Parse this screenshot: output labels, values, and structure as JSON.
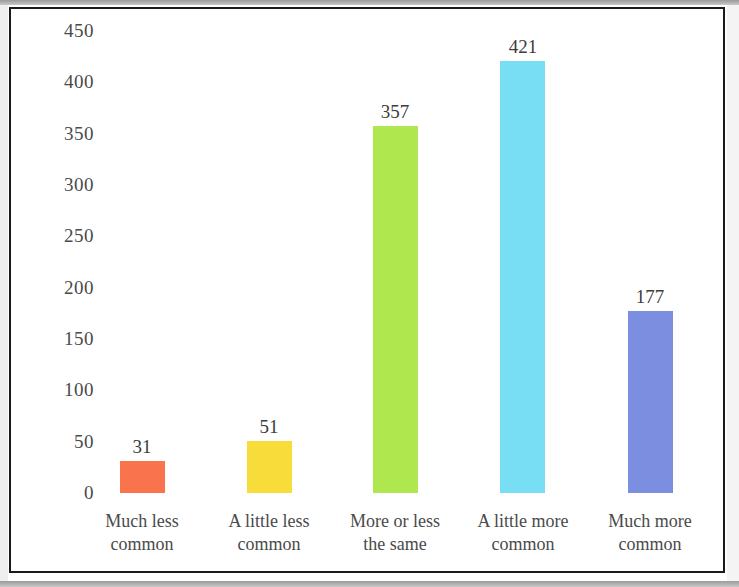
{
  "chart_data": {
    "type": "bar",
    "title": "",
    "subtitle": "",
    "xlabel": "",
    "ylabel": "",
    "categories": [
      "Much less common",
      "A little less common",
      "More or less the same",
      "A little more common",
      "Much more common"
    ],
    "category_lines": [
      [
        "Much less",
        "common"
      ],
      [
        "A little less",
        "common"
      ],
      [
        "More or less",
        "the same"
      ],
      [
        "A little more",
        "common"
      ],
      [
        "Much more",
        "common"
      ]
    ],
    "values": [
      31,
      51,
      357,
      421,
      177
    ],
    "value_labels": [
      "31",
      "51",
      "357",
      "421",
      "177"
    ],
    "bar_colors": [
      "#F9734D",
      "#F8DC39",
      "#AFE84E",
      "#78DEF3",
      "#7B8EDF"
    ],
    "ylim": [
      0,
      450
    ],
    "yticks": [
      0,
      50,
      100,
      150,
      200,
      250,
      300,
      350,
      400,
      450
    ],
    "ytick_labels": [
      "0",
      "50",
      "100",
      "150",
      "200",
      "250",
      "300",
      "350",
      "400",
      "450"
    ],
    "grid": false,
    "legend": null,
    "legend_position": "none",
    "annotations": []
  },
  "figure": {
    "border_color": "#1a1a1a",
    "background_color": "#ffffff",
    "text_color": "#4a4a4a"
  }
}
